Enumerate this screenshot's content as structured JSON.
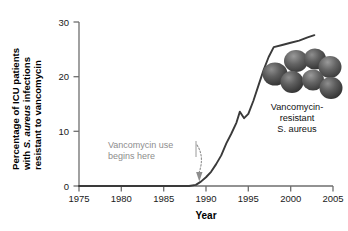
{
  "figure": {
    "background_color": "#ffffff",
    "line_color": "#3a3a3a",
    "axis_color": "#6e6e6e",
    "annotation_color": "#8d8d8d",
    "text_color": "#111111"
  },
  "axes": {
    "ylabel_line1": "Percentage of ICU patients",
    "ylabel_line2_prefix": "with ",
    "ylabel_line2_italic": "S. aureus",
    "ylabel_line2_suffix": " infections",
    "ylabel_line3": "resistant to vancomycin",
    "xlabel": "Year",
    "y_ticks": [
      "0",
      "10",
      "20",
      "30"
    ],
    "x_ticks": [
      "1975",
      "1980",
      "1985",
      "1990",
      "1995",
      "2000",
      "2005"
    ]
  },
  "annotations": {
    "vancomycin_use_line1": "Vancomycin use",
    "vancomycin_use_line2": "begins here",
    "arrow_target_year": 1988.6,
    "photo_caption_line1": "Vancomycin-",
    "photo_caption_line2": "resistant",
    "photo_caption_line3_italic": "S. aureus"
  },
  "photo": {
    "description": "staphylococcus-aureus-cocci-cluster-micrograph",
    "cell_count": 7,
    "cell_color": "#585858"
  },
  "chart_data": {
    "type": "line",
    "title": "",
    "xlabel": "Year",
    "ylabel": "Percentage of ICU patients with S. aureus infections resistant to vancomycin",
    "xlim": [
      1975,
      2005
    ],
    "ylim": [
      0,
      30
    ],
    "grid": false,
    "legend": false,
    "series": [
      {
        "name": "Percentage vancomycin-resistant S. aureus in ICU patients",
        "x": [
          1975,
          1980,
          1985,
          1987,
          1988,
          1988.8,
          1989.4,
          1990,
          1990.6,
          1991.2,
          1991.8,
          1992.4,
          1993,
          1993.6,
          1994,
          1994.5,
          1995,
          1995.6,
          1996.2,
          1996.8,
          1997.4,
          1998,
          1999,
          2000,
          2001,
          2002,
          2002.8
        ],
        "y": [
          0,
          0,
          0,
          0,
          0,
          0.2,
          0.8,
          1.6,
          2.6,
          4.0,
          5.6,
          7.8,
          9.6,
          11.6,
          13.6,
          12.4,
          13.2,
          15.6,
          18.4,
          21.2,
          23.6,
          25.4,
          25.8,
          26.2,
          26.6,
          27.2,
          27.6
        ]
      }
    ]
  }
}
